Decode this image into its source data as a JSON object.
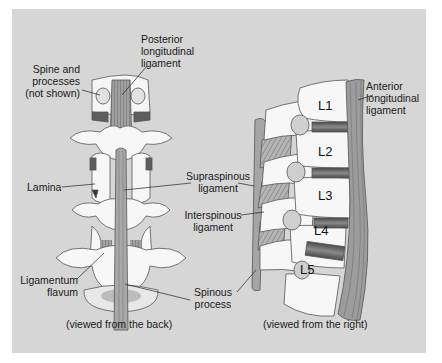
{
  "figure": {
    "background_color": "#d6d6d6",
    "panels": [
      {
        "id": "back-view",
        "caption": "(viewed from the back)",
        "labels": {
          "posterior_longitudinal_ligament": "Posterior\nlongitudinal\nligament",
          "spine_and_processes": "Spine and\nprocesses\n(not shown)",
          "lamina": "Lamina",
          "ligamentum_flavum": "Ligamentum\nflavum"
        }
      },
      {
        "id": "right-view",
        "caption": "(viewed from the right)",
        "labels": {
          "anterior_longitudinal_ligament": "Anterior\nlongitudinal\nligament"
        },
        "vertebrae": [
          "L1",
          "L2",
          "L3",
          "L4",
          "L5"
        ]
      }
    ],
    "shared_labels": {
      "supraspinous_ligament": "Supraspinous\nligament",
      "interspinous_ligament": "Interspinous\nligament",
      "spinous_process": "Spinous\nprocess"
    },
    "colors": {
      "bone": "#f7f7f7",
      "disc": "#6f6f6f",
      "ligament": "#9a9a9a",
      "outline": "#555555"
    }
  }
}
